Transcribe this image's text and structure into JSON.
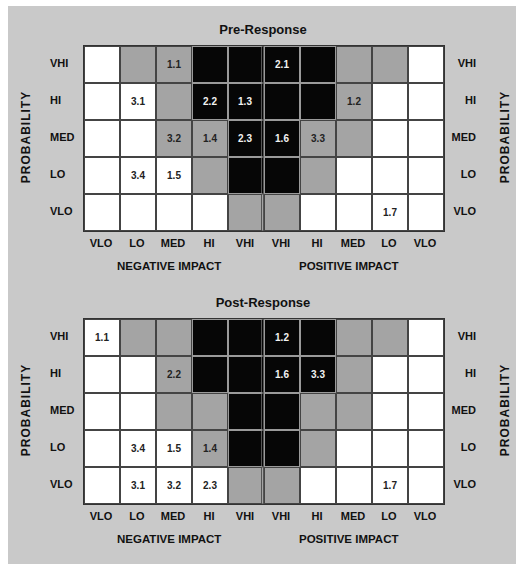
{
  "colors": {
    "panel": "#c9c9c9",
    "high": "#060606",
    "medium": "#a4a4a4",
    "low": "#ffffff"
  },
  "axes": {
    "probability_label": "PROBABILITY",
    "rows": [
      "VHI",
      "HI",
      "MED",
      "LO",
      "VLO"
    ],
    "columns": [
      "VLO",
      "LO",
      "MED",
      "HI",
      "VHI",
      "VHI",
      "HI",
      "MED",
      "LO",
      "VLO"
    ],
    "negative_label": "NEGATIVE IMPACT",
    "positive_label": "POSITIVE IMPACT"
  },
  "matrices": [
    {
      "title": "Pre-Response",
      "shading": [
        [
          "w",
          "g",
          "g",
          "b",
          "b",
          "b",
          "b",
          "g",
          "g",
          "w"
        ],
        [
          "w",
          "w",
          "g",
          "b",
          "b",
          "b",
          "b",
          "g",
          "w",
          "w"
        ],
        [
          "w",
          "w",
          "g",
          "g",
          "b",
          "b",
          "g",
          "g",
          "w",
          "w"
        ],
        [
          "w",
          "w",
          "w",
          "g",
          "b",
          "b",
          "g",
          "w",
          "w",
          "w"
        ],
        [
          "w",
          "w",
          "w",
          "w",
          "g",
          "g",
          "w",
          "w",
          "w",
          "w"
        ]
      ],
      "labels": [
        [
          "",
          "",
          "1.1",
          "",
          "",
          "2.1",
          "",
          "",
          "",
          ""
        ],
        [
          "",
          "3.1",
          "",
          "2.2",
          "1.3",
          "",
          "",
          "1.2",
          "",
          ""
        ],
        [
          "",
          "",
          "3.2",
          "1.4",
          "2.3",
          "1.6",
          "3.3",
          "",
          "",
          ""
        ],
        [
          "",
          "3.4",
          "1.5",
          "",
          "",
          "",
          "",
          "",
          "",
          ""
        ],
        [
          "",
          "",
          "",
          "",
          "",
          "",
          "",
          "",
          "1.7",
          ""
        ]
      ]
    },
    {
      "title": "Post-Response",
      "shading": [
        [
          "w",
          "g",
          "g",
          "b",
          "b",
          "b",
          "b",
          "g",
          "g",
          "w"
        ],
        [
          "w",
          "w",
          "g",
          "b",
          "b",
          "b",
          "b",
          "g",
          "w",
          "w"
        ],
        [
          "w",
          "w",
          "g",
          "g",
          "b",
          "b",
          "g",
          "g",
          "w",
          "w"
        ],
        [
          "w",
          "w",
          "w",
          "g",
          "b",
          "b",
          "g",
          "w",
          "w",
          "w"
        ],
        [
          "w",
          "w",
          "w",
          "w",
          "g",
          "g",
          "w",
          "w",
          "w",
          "w"
        ]
      ],
      "labels": [
        [
          "1.1",
          "",
          "",
          "",
          "",
          "1.2",
          "",
          "",
          "",
          ""
        ],
        [
          "",
          "",
          "2.2",
          "",
          "",
          "1.6",
          "3.3",
          "",
          "",
          ""
        ],
        [
          "",
          "",
          "",
          "",
          "",
          "",
          "",
          "",
          "",
          ""
        ],
        [
          "",
          "3.4",
          "1.5",
          "1.4",
          "",
          "",
          "",
          "",
          "",
          ""
        ],
        [
          "",
          "3.1",
          "3.2",
          "2.3",
          "",
          "",
          "",
          "",
          "1.7",
          ""
        ]
      ]
    }
  ],
  "chart_data": [
    {
      "type": "heatmap",
      "title": "Pre-Response",
      "ylabel": "PROBABILITY",
      "y_categories": [
        "VHI",
        "HI",
        "MED",
        "LO",
        "VLO"
      ],
      "x_categories": [
        "VLO",
        "LO",
        "MED",
        "HI",
        "VHI",
        "VHI",
        "HI",
        "MED",
        "LO",
        "VLO"
      ],
      "x_groups": [
        {
          "label": "NEGATIVE IMPACT",
          "columns": [
            0,
            1,
            2,
            3,
            4
          ]
        },
        {
          "label": "POSITIVE IMPACT",
          "columns": [
            5,
            6,
            7,
            8,
            9
          ]
        }
      ],
      "legend": {
        "b": "high risk (black)",
        "g": "medium risk (gray)",
        "w": "low risk (white)"
      },
      "risks": [
        {
          "id": "1.1",
          "probability": "VHI",
          "impact": "MED",
          "side": "negative"
        },
        {
          "id": "2.1",
          "probability": "VHI",
          "impact": "VHI",
          "side": "positive"
        },
        {
          "id": "3.1",
          "probability": "HI",
          "impact": "LO",
          "side": "negative"
        },
        {
          "id": "2.2",
          "probability": "HI",
          "impact": "HI",
          "side": "negative"
        },
        {
          "id": "1.3",
          "probability": "HI",
          "impact": "VHI",
          "side": "negative"
        },
        {
          "id": "1.2",
          "probability": "HI",
          "impact": "MED",
          "side": "positive"
        },
        {
          "id": "3.2",
          "probability": "MED",
          "impact": "MED",
          "side": "negative"
        },
        {
          "id": "1.4",
          "probability": "MED",
          "impact": "HI",
          "side": "negative"
        },
        {
          "id": "2.3",
          "probability": "MED",
          "impact": "VHI",
          "side": "negative"
        },
        {
          "id": "1.6",
          "probability": "MED",
          "impact": "VHI",
          "side": "positive"
        },
        {
          "id": "3.3",
          "probability": "MED",
          "impact": "HI",
          "side": "positive"
        },
        {
          "id": "3.4",
          "probability": "LO",
          "impact": "LO",
          "side": "negative"
        },
        {
          "id": "1.5",
          "probability": "LO",
          "impact": "MED",
          "side": "negative"
        },
        {
          "id": "1.7",
          "probability": "VLO",
          "impact": "LO",
          "side": "positive"
        }
      ]
    },
    {
      "type": "heatmap",
      "title": "Post-Response",
      "ylabel": "PROBABILITY",
      "y_categories": [
        "VHI",
        "HI",
        "MED",
        "LO",
        "VLO"
      ],
      "x_categories": [
        "VLO",
        "LO",
        "MED",
        "HI",
        "VHI",
        "VHI",
        "HI",
        "MED",
        "LO",
        "VLO"
      ],
      "x_groups": [
        {
          "label": "NEGATIVE IMPACT",
          "columns": [
            0,
            1,
            2,
            3,
            4
          ]
        },
        {
          "label": "POSITIVE IMPACT",
          "columns": [
            5,
            6,
            7,
            8,
            9
          ]
        }
      ],
      "legend": {
        "b": "high risk (black)",
        "g": "medium risk (gray)",
        "w": "low risk (white)"
      },
      "risks": [
        {
          "id": "1.1",
          "probability": "VHI",
          "impact": "VLO",
          "side": "negative"
        },
        {
          "id": "1.2",
          "probability": "VHI",
          "impact": "VHI",
          "side": "positive"
        },
        {
          "id": "2.2",
          "probability": "HI",
          "impact": "MED",
          "side": "negative"
        },
        {
          "id": "1.6",
          "probability": "HI",
          "impact": "VHI",
          "side": "positive"
        },
        {
          "id": "3.3",
          "probability": "HI",
          "impact": "HI",
          "side": "positive"
        },
        {
          "id": "3.4",
          "probability": "LO",
          "impact": "LO",
          "side": "negative"
        },
        {
          "id": "1.5",
          "probability": "LO",
          "impact": "MED",
          "side": "negative"
        },
        {
          "id": "1.4",
          "probability": "LO",
          "impact": "HI",
          "side": "negative"
        },
        {
          "id": "3.1",
          "probability": "VLO",
          "impact": "LO",
          "side": "negative"
        },
        {
          "id": "3.2",
          "probability": "VLO",
          "impact": "MED",
          "side": "negative"
        },
        {
          "id": "2.3",
          "probability": "VLO",
          "impact": "HI",
          "side": "negative"
        },
        {
          "id": "1.7",
          "probability": "VLO",
          "impact": "LO",
          "side": "positive"
        }
      ]
    }
  ]
}
